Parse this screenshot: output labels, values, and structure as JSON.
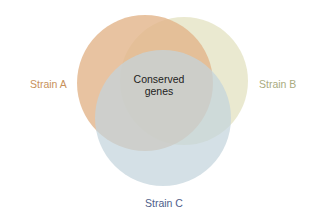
{
  "diagram": {
    "type": "venn",
    "sets": [
      {
        "id": "A",
        "label": "Strain A",
        "fill": "#e2b48a",
        "label_color": "#c8915a",
        "cx": 145,
        "cy": 83,
        "r": 68
      },
      {
        "id": "B",
        "label": "Strain B",
        "fill": "#e6e5c8",
        "label_color": "#a9ab80",
        "cx": 184,
        "cy": 81,
        "r": 64
      },
      {
        "id": "C",
        "label": "Strain C",
        "fill": "#c3d4dd",
        "label_color": "#4e5e8a",
        "cx": 163,
        "cy": 118,
        "r": 68
      }
    ],
    "intersection_label_line1": "Conserved",
    "intersection_label_line2": "genes"
  }
}
